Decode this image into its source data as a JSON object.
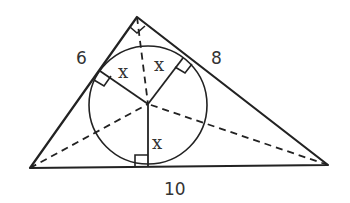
{
  "diagram": {
    "type": "right triangle with inscribed circle",
    "labels": {
      "left_side": "6",
      "right_side": "8",
      "base": "10",
      "radius_left": "x",
      "radius_right": "x",
      "radius_bottom": "x"
    }
  }
}
